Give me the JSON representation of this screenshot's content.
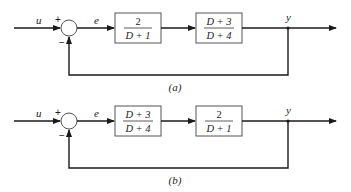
{
  "diagrams": [
    {
      "id": "a",
      "caption": "(a)",
      "input_label": "u",
      "error_label": "e",
      "output_label": "y",
      "sum_plus": "+",
      "sum_minus": "−",
      "blocks": [
        {
          "numerator": "2",
          "denominator": "D + 1"
        },
        {
          "numerator": "D + 3",
          "denominator": "D + 4"
        }
      ]
    },
    {
      "id": "b",
      "caption": "(b)",
      "input_label": "u",
      "error_label": "e",
      "output_label": "y",
      "sum_plus": "+",
      "sum_minus": "−",
      "blocks": [
        {
          "numerator": "D + 3",
          "denominator": "D + 4"
        },
        {
          "numerator": "2",
          "denominator": "D + 1"
        }
      ]
    }
  ]
}
